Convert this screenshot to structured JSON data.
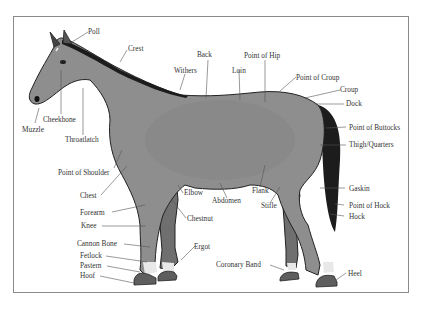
{
  "diagram": {
    "colors": {
      "body": "#8e8e8e",
      "body_shade": "#7d7d7d",
      "leg_far": "#6f6f6f",
      "mane_tail": "#1c1c1c",
      "outline": "#222222",
      "hoof": "#5e5e5e",
      "sock": "#e8e8e8",
      "label": "#333333",
      "leader": "#555555",
      "frame": "#8a8a8a"
    },
    "labels": {
      "poll": "Poll",
      "crest": "Crest",
      "back": "Back",
      "withers": "Withers",
      "loin": "Loin",
      "point_of_hip": "Point of Hip",
      "point_of_croup": "Point of Croup",
      "croup": "Croup",
      "dock": "Dock",
      "cheekbone": "Cheekbone",
      "muzzle": "Muzzle",
      "throatlatch": "Throatlatch",
      "point_of_buttocks": "Point of Buttocks",
      "thigh_quarters": "Thigh/Quarters",
      "point_of_shoulder": "Point of Shoulder",
      "chest": "Chest",
      "elbow": "Elbow",
      "abdomen": "Abdomen",
      "flank": "Flank",
      "stifle": "Stifle",
      "gaskin": "Gaskin",
      "forearm": "Forearm",
      "chestnut": "Chestnut",
      "point_of_hock": "Point of Hock",
      "knee": "Knee",
      "hock": "Hock",
      "cannon_bone": "Cannon Bone",
      "ergot": "Ergot",
      "fetlock": "Fetlock",
      "pastern": "Pastern",
      "coronary_band": "Coronary Band",
      "hoof": "Hoof",
      "heel": "Heel"
    }
  }
}
